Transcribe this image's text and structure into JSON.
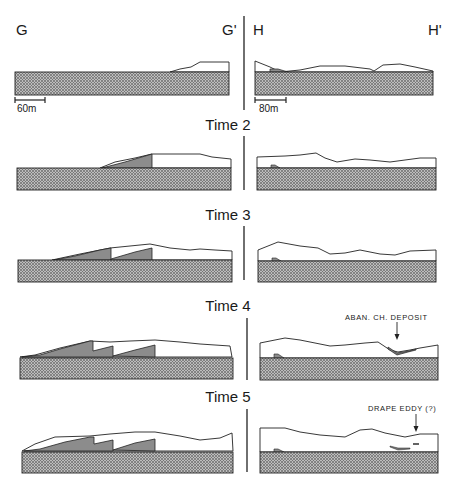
{
  "sections": {
    "left_start": "G",
    "left_end": "G'",
    "right_start": "H",
    "right_end": "H'"
  },
  "scales": {
    "left": "60m",
    "right": "80m"
  },
  "panels": [
    {
      "time_label": ""
    },
    {
      "time_label": "Time 2"
    },
    {
      "time_label": "Time 3"
    },
    {
      "time_label": "Time 4"
    },
    {
      "time_label": "Time 5"
    }
  ],
  "annotations": {
    "time4": "ABAN. CH. DEPOSIT",
    "time5": "DRAPE  EDDY (?)"
  },
  "colors": {
    "bedrock_fill": "#a8a8a8",
    "deposit_fill": "#8c8c8c",
    "line": "#222222"
  }
}
